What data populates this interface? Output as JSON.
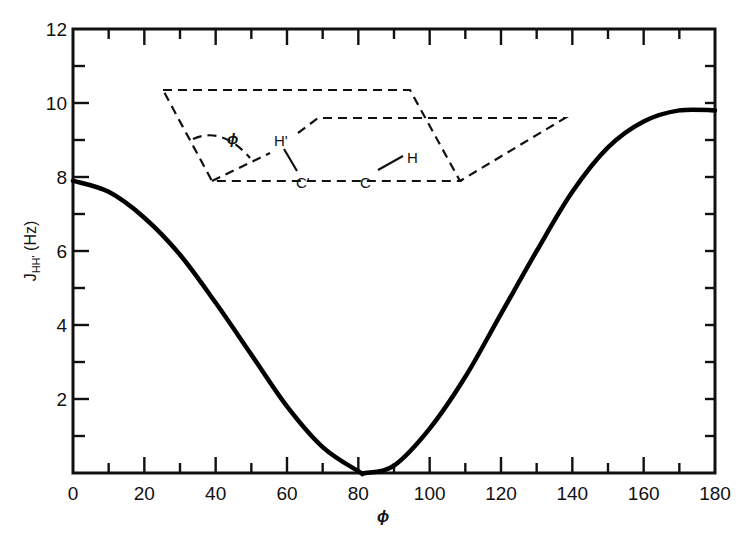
{
  "chart_data": {
    "type": "line",
    "title": "",
    "xlabel": "ϕ",
    "ylabel": "J_HH' (Hz)",
    "ylabel_main": "J",
    "ylabel_sub": "HH'",
    "ylabel_unit": " (Hz)",
    "xlim": [
      0,
      180
    ],
    "ylim": [
      0,
      12
    ],
    "x_ticks": [
      0,
      20,
      40,
      60,
      80,
      100,
      120,
      140,
      160,
      180
    ],
    "x_minor_ticks": [
      10,
      30,
      50,
      70,
      90,
      110,
      130,
      150,
      170
    ],
    "y_ticks": [
      2,
      4,
      6,
      8,
      10,
      12
    ],
    "y_minor_ticks": [
      1,
      3,
      5,
      7,
      9,
      11
    ],
    "x_tick_labels": [
      "0",
      "20",
      "40",
      "60",
      "80",
      "100",
      "120",
      "140",
      "160",
      "180"
    ],
    "y_tick_labels": [
      "2",
      "4",
      "6",
      "8",
      "10",
      "12"
    ],
    "x_zero_label": "0",
    "grid": false,
    "legend": null,
    "series": [
      {
        "name": "Karplus curve",
        "x": [
          0,
          10,
          20,
          30,
          40,
          50,
          60,
          70,
          80,
          82,
          90,
          100,
          110,
          120,
          130,
          140,
          150,
          160,
          170,
          180
        ],
        "values": [
          7.9,
          7.6,
          6.9,
          5.9,
          4.6,
          3.2,
          1.8,
          0.7,
          0.05,
          0.0,
          0.2,
          1.2,
          2.6,
          4.3,
          6.0,
          7.6,
          8.8,
          9.5,
          9.8,
          9.8
        ]
      }
    ],
    "annotations": {
      "inset": "Dihedral angle diagram: two dashed planes intersecting along C'–C bond",
      "angle_label": "ϕ",
      "atoms": [
        "H'",
        "C'",
        "C",
        "H"
      ]
    }
  }
}
